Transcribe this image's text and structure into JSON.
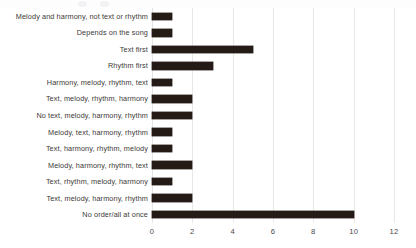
{
  "chart_data": {
    "type": "bar",
    "orientation": "horizontal",
    "title": "",
    "subtitle": "",
    "xlabel": "",
    "ylabel": "",
    "xlim": [
      0,
      12
    ],
    "xticks": [
      0,
      2,
      4,
      6,
      8,
      10,
      12
    ],
    "grid": "vertical",
    "legend": "none",
    "bar_color": "#241b17",
    "gridline_color": "#e9e7e4",
    "background_color": "#ffffff",
    "categories": [
      "Melody and harmony, not text or rhythm",
      "Depends on the song",
      "Text first",
      "Rhythm first",
      "Harmony, melody, rhythm, text",
      "Text, melody, rhythm, harmony",
      "No text, melody, harmony, rhythm",
      "Melody, text, harmony, rhythm",
      "Text, harmony, rhythm, melody",
      "Melody, harmony, rhythm, text",
      "Text, rhythm, melody, harmony",
      "Text, melody, harmony, rhythm",
      "No order/all at once"
    ],
    "values": [
      1,
      1,
      5,
      3,
      1,
      2,
      2,
      1,
      1,
      2,
      1,
      2,
      10
    ]
  }
}
